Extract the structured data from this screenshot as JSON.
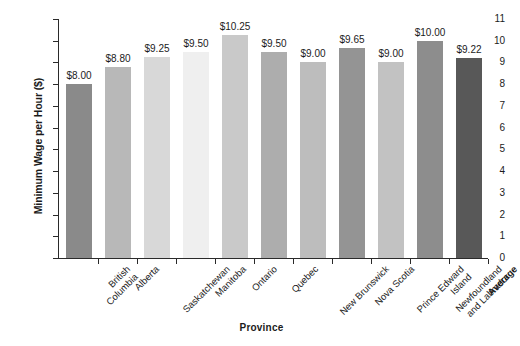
{
  "chart_data": {
    "type": "bar",
    "title": "",
    "xlabel": "Province",
    "ylabel": "Minimum Wage per Hour ($)",
    "ylim": [
      0,
      11
    ],
    "y_ticks": [
      0,
      1,
      2,
      3,
      4,
      5,
      6,
      7,
      8,
      9,
      10,
      11
    ],
    "grid": false,
    "legend": "none",
    "categories": [
      "British Columbia",
      "Alberta",
      "Saskatchewan",
      "Manitoba",
      "Ontario",
      "Quebec",
      "New Brunswick",
      "Nova Scotia",
      "Prince Edward Island",
      "Newfoundland and Labrador",
      "Average"
    ],
    "category_lines": [
      [
        "British",
        "Columbia"
      ],
      [
        "Alberta"
      ],
      [
        "Saskatchewan"
      ],
      [
        "Manitoba"
      ],
      [
        "Ontario"
      ],
      [
        "Quebec"
      ],
      [
        "New Brunswick"
      ],
      [
        "Nova Scotia"
      ],
      [
        "Prince Edward",
        "Island"
      ],
      [
        "Newfoundland",
        "and Labrador"
      ],
      [
        "Average"
      ]
    ],
    "values": [
      8.0,
      8.8,
      9.25,
      9.5,
      10.25,
      9.5,
      9.0,
      9.65,
      9.0,
      10.0,
      9.22
    ],
    "data_labels": [
      "$8.00",
      "$8.80",
      "$9.25",
      "$9.50",
      "$10.25",
      "$9.50",
      "$9.00",
      "$9.65",
      "$9.00",
      "$10.00",
      "$9.22"
    ],
    "bar_colors": [
      "#8a8a8a",
      "#b8b8b8",
      "#d8d8d8",
      "#efefef",
      "#c9c9c9",
      "#adadad",
      "#bdbdbd",
      "#949494",
      "#c2c2c2",
      "#8d8d8d",
      "#585858"
    ],
    "bold_categories": [
      "Average"
    ],
    "axis_color": "#2a2a2a",
    "text_color": "#1b1b1b",
    "background": "#ffffff"
  }
}
